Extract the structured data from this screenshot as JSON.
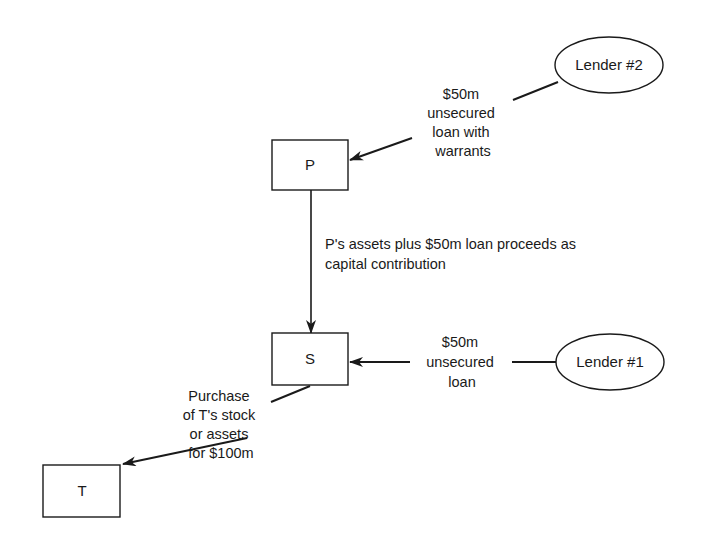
{
  "nodes": {
    "p": {
      "label": "P",
      "shape": "rectangle"
    },
    "s": {
      "label": "S",
      "shape": "rectangle"
    },
    "t": {
      "label": "T",
      "shape": "rectangle"
    },
    "lender2": {
      "label": "Lender #2",
      "shape": "ellipse"
    },
    "lender1": {
      "label": "Lender #1",
      "shape": "ellipse"
    }
  },
  "edges": {
    "lender2_to_p": {
      "from": "Lender #2",
      "to": "P",
      "lines": [
        "$50m",
        "unsecured",
        "loan with",
        "warrants"
      ]
    },
    "p_to_s": {
      "from": "P",
      "to": "S",
      "lines": [
        "P's assets plus $50m loan proceeds as",
        "capital contribution"
      ]
    },
    "lender1_to_s": {
      "from": "Lender #1",
      "to": "S",
      "lines": [
        "$50m",
        "unsecured",
        "loan"
      ]
    },
    "s_to_t": {
      "from": "S",
      "to": "T",
      "lines": [
        "Purchase",
        "of T's stock",
        "or assets",
        "for $100m"
      ]
    }
  },
  "colors": {
    "ink": "#1a1a1a",
    "background": "#ffffff"
  }
}
